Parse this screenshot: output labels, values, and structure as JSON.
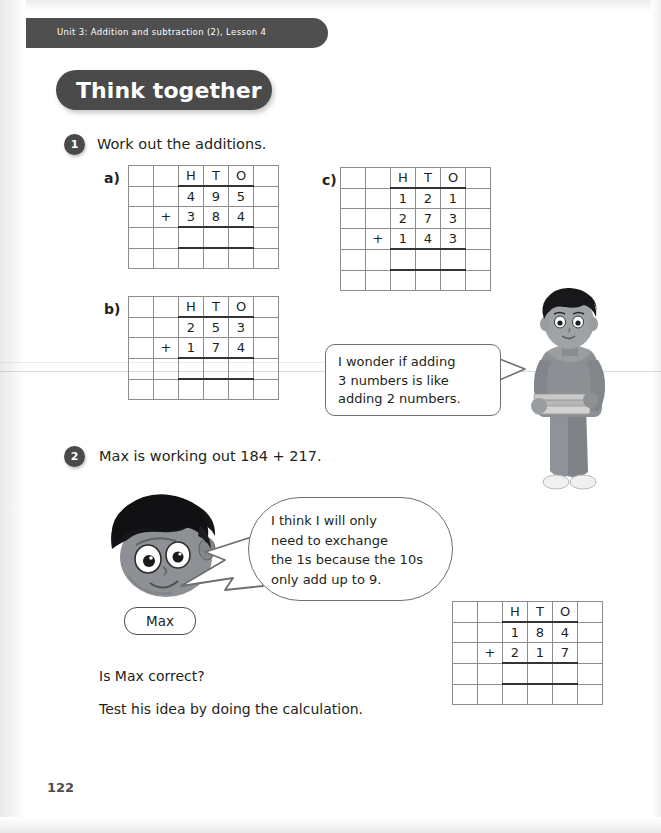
{
  "header": {
    "unit_label": "Unit 3: Addition and subtraction (2), Lesson 4",
    "banner_title": "Think together",
    "banner_color": "#4a4a4a",
    "strip_color": "#4f4f4f"
  },
  "questions": [
    {
      "number": "1",
      "text": "Work out the additions.",
      "parts": [
        {
          "label": "a)",
          "addends": [
            "495",
            "384"
          ]
        },
        {
          "label": "b)",
          "addends": [
            "253",
            "174"
          ]
        },
        {
          "label": "c)",
          "addends": [
            "121",
            "273",
            "143"
          ]
        }
      ]
    },
    {
      "number": "2",
      "text": "Max is working out 184 + 217.",
      "grid_addends": [
        "184",
        "217"
      ]
    }
  ],
  "grid": {
    "headers": [
      "H",
      "T",
      "O"
    ],
    "plus_sign": "+"
  },
  "bubbles": [
    {
      "id": "girl-bubble",
      "text": "I wonder if adding\n3 numbers is like\nadding 2 numbers."
    },
    {
      "id": "max-bubble",
      "text": "I think I will only\nneed to exchange\nthe 1s because the 10s\nonly add up to 9."
    }
  ],
  "characters": [
    {
      "name": "girl-with-books",
      "label": ""
    },
    {
      "name": "max-head",
      "label": "Max"
    }
  ],
  "max_name_pill": "Max",
  "prompts": [
    "Is Max correct?",
    "Test his idea by doing the calculation."
  ],
  "page_number": "122"
}
